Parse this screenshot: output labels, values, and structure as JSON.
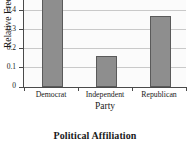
{
  "chart_data": {
    "type": "bar",
    "title": "",
    "caption": "Political Affiliation",
    "xlabel": "Party",
    "ylabel": "Relative Frequency",
    "categories": [
      "Democrat",
      "Independent",
      "Republican"
    ],
    "values": [
      0.46,
      0.16,
      0.37
    ],
    "ylim": [
      0,
      0.5
    ],
    "yticks": [
      0,
      0.1,
      0.2,
      0.3,
      0.4,
      0.5
    ],
    "ytick_labels": [
      "0",
      "0.1",
      "0.2",
      "0.3",
      "0.4",
      "0.5"
    ],
    "grid": "horizontal",
    "legend": "none",
    "bar_fill_color": "#8e8e8e",
    "bar_edge_color": "#5a5a5a",
    "gridline_color": "#c9c9c9",
    "axis_color": "#4a4a4a",
    "plot_background": "#fbfbfb",
    "note": "top 0.5 tick label is clipped by the top edge of the image"
  }
}
